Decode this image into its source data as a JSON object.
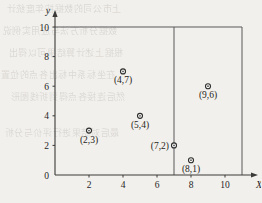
{
  "chart_data": {
    "type": "scatter",
    "title": "",
    "subtitle": "",
    "xlabel": "X",
    "ylabel": "y",
    "xlim": [
      0,
      11
    ],
    "ylim": [
      0,
      10
    ],
    "grid": false,
    "legend": null,
    "x_ticks": [
      "2",
      "4",
      "6",
      "8",
      "10"
    ],
    "x_tick_values": [
      2,
      4,
      6,
      8,
      10
    ],
    "y_ticks": [
      "0",
      "2",
      "4",
      "6",
      "8",
      "10"
    ],
    "y_tick_values": [
      0,
      2,
      4,
      6,
      8,
      10
    ],
    "points": [
      {
        "label": "(2,3)",
        "x": 2,
        "y": 3
      },
      {
        "label": "(4,7)",
        "x": 4,
        "y": 7
      },
      {
        "label": "(5,4)",
        "x": 5,
        "y": 4
      },
      {
        "label": "(7,2)",
        "x": 7,
        "y": 2
      },
      {
        "label": "(8,1)",
        "x": 8,
        "y": 1
      },
      {
        "label": "(9,6)",
        "x": 9,
        "y": 6
      }
    ],
    "annotations": [
      {
        "name": "top-boundary-line",
        "type": "hline",
        "y": 10,
        "x_from": 0,
        "x_to": 11
      },
      {
        "name": "vertical-split-line",
        "type": "vline",
        "x": 7,
        "y_from": 0,
        "y_to": 10
      },
      {
        "name": "right-boundary-line",
        "type": "vline",
        "x": 11,
        "y_from": 0,
        "y_to": 10
      }
    ],
    "colors": {
      "axis": "#3a3a38",
      "frame": "#58585a",
      "marker_fill": "#ffffff",
      "marker_stroke": "#2e2e2c",
      "text": "#26251f",
      "background": "#f2f0ec"
    }
  },
  "bleed_through": {
    "lines": [
      "上市公司的数据按年度统计",
      "数据分析方法与应用实例说",
      "根据上述计算结果可以得出",
      "在坐标系中标出各点的位置",
      "然后连接各点得到折线图形",
      "最后对结果进行评价与分析"
    ]
  }
}
